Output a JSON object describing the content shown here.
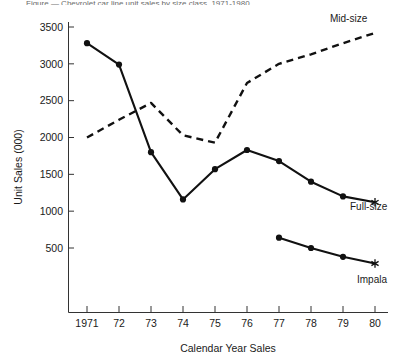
{
  "caption": {
    "sliver_text": "Figure — Chevrolet car line unit sales by size class, 1971-1980"
  },
  "axes": {
    "y_title": "Unit Sales (000)",
    "x_title": "Calendar Year Sales",
    "y_ticks": [
      "500",
      "1000",
      "1500",
      "2000",
      "2500",
      "3000",
      "3500"
    ],
    "x_ticks": [
      "1971",
      "72",
      "73",
      "74",
      "75",
      "76",
      "77",
      "78",
      "79",
      "80"
    ]
  },
  "labels": {
    "midsize": "Mid-size",
    "fullsize": "Full-size",
    "impala": "Impala"
  },
  "colors": {
    "line": "#111111",
    "axis": "#333333",
    "text": "#1a1a1a",
    "background": "#ffffff"
  },
  "chart_data": {
    "type": "line",
    "title": "",
    "xlabel": "Calendar Year Sales",
    "ylabel": "Unit Sales (000)",
    "xlim": [
      1970.6,
      1980.5
    ],
    "ylim": [
      130,
      3620
    ],
    "grid": false,
    "legend_position": "inline-right-end-of-line",
    "x": [
      1971,
      1972,
      1973,
      1974,
      1975,
      1976,
      1977,
      1978,
      1979,
      1980
    ],
    "series": [
      {
        "name": "Mid-size",
        "style": "dashed",
        "markers": "none",
        "end_marker": "none",
        "x": [
          1971,
          1972,
          1973,
          1974,
          1975,
          1976,
          1977,
          1978,
          1979,
          1980
        ],
        "values": [
          2000,
          2240,
          2470,
          2030,
          1930,
          2740,
          3000,
          3130,
          3280,
          3420
        ]
      },
      {
        "name": "Full-size",
        "style": "solid",
        "markers": "filled-circle",
        "end_marker": "asterisk",
        "x": [
          1971,
          1972,
          1973,
          1974,
          1975,
          1976,
          1977,
          1978,
          1979,
          1980
        ],
        "values": [
          3280,
          2990,
          1800,
          1160,
          1570,
          1830,
          1680,
          1400,
          1200,
          1120
        ]
      },
      {
        "name": "Impala",
        "style": "solid",
        "markers": "filled-circle",
        "end_marker": "asterisk",
        "x": [
          1977,
          1978,
          1979,
          1980
        ],
        "values": [
          640,
          500,
          380,
          290
        ]
      }
    ]
  }
}
